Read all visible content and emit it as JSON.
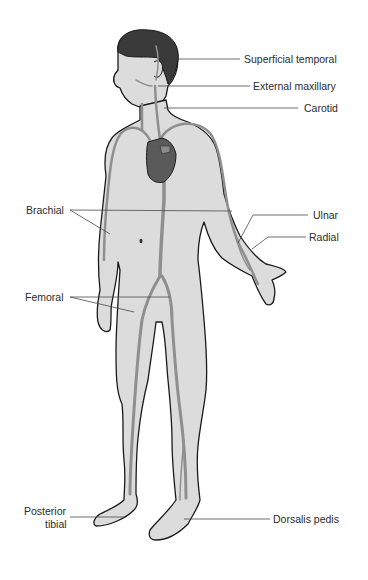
{
  "diagram": {
    "colors": {
      "skin_fill": "#dcdcdc",
      "outline": "#1a1a1a",
      "artery": "#8f8f8f",
      "heart": "#5a5a5a",
      "hair": "#3a3a3a",
      "leader_line": "#4a4a4a",
      "label_text": "#2b2b2b"
    },
    "labels": {
      "superficial_temporal": "Superficial temporal",
      "external_maxillary": "External maxillary",
      "carotid": "Carotid",
      "brachial": "Brachial",
      "ulnar": "Ulnar",
      "radial": "Radial",
      "femoral": "Femoral",
      "posterior_tibial_line1": "Posterior",
      "posterior_tibial_line2": "tibial",
      "dorsalis_pedis": "Dorsalis pedis"
    }
  }
}
